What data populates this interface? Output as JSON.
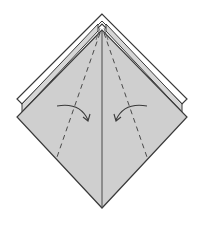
{
  "diagram": {
    "type": "origami-step",
    "colors": {
      "background": "#ffffff",
      "paper_fill": "#cfcfcf",
      "back_layer_fill": "#d6d6d6",
      "line": "#4a4a4a",
      "outline": "#3a3a3a"
    },
    "shapes": {
      "front_diamond": {
        "top": [
          102,
          30
        ],
        "left": [
          17,
          117
        ],
        "right": [
          187,
          117
        ],
        "bottom": [
          102,
          208
        ]
      },
      "back_flap_outer": {
        "top": [
          102,
          14
        ],
        "left": [
          17,
          99
        ],
        "right": [
          187,
          99
        ]
      },
      "center_line": {
        "from": [
          102,
          30
        ],
        "to": [
          102,
          208
        ]
      },
      "left_valley_fold": {
        "from": [
          100,
          33
        ],
        "to": [
          56,
          160
        ]
      },
      "right_valley_fold": {
        "from": [
          104,
          33
        ],
        "to": [
          148,
          160
        ]
      }
    },
    "arrows": [
      {
        "name": "fold-left-edge-arrow",
        "from": [
          57,
          107
        ],
        "to": [
          88,
          120
        ],
        "direction": "right"
      },
      {
        "name": "fold-right-edge-arrow",
        "from": [
          147,
          107
        ],
        "to": [
          116,
          120
        ],
        "direction": "left"
      }
    ]
  }
}
